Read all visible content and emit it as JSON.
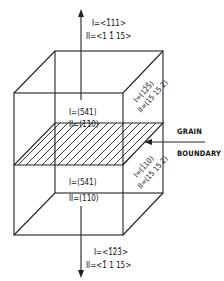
{
  "diagram": {
    "top_axis": {
      "line1": "I=<1̄11>",
      "line2": "II=<1 1̄ 15>"
    },
    "bottom_axis": {
      "line1": "I=<1̄2̄3̄>",
      "line2": "II=<1̄ 1 15>"
    },
    "upper_front_face": {
      "line1": "I=(541)",
      "line2": "II=(110)"
    },
    "lower_front_face": {
      "line1": "I=(541)",
      "line2": "II=(110)"
    },
    "upper_side_face": {
      "line1": "I=(12̄5̄)",
      "line2": "II=(15 15 2)"
    },
    "lower_side_face": {
      "line1": "I=(1̄10)",
      "line2": "II=(15 15 2)"
    },
    "grain_boundary_label": {
      "line1": "GRAIN",
      "line2": "BOUNDARY"
    },
    "colors": {
      "line": "#222222",
      "background": "#ffffff"
    }
  }
}
